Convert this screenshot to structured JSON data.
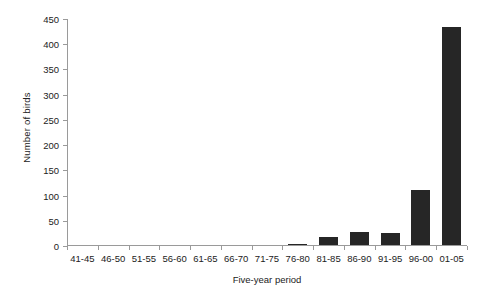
{
  "chart_data": {
    "type": "bar",
    "title": "",
    "xlabel": "Five-year period",
    "ylabel": "Number of birds",
    "categories": [
      "41-45",
      "46-50",
      "51-55",
      "56-60",
      "61-65",
      "66-70",
      "71-75",
      "76-80",
      "81-85",
      "86-90",
      "91-95",
      "96-00",
      "01-05"
    ],
    "values": [
      0,
      0,
      0,
      0,
      0,
      0,
      0,
      3,
      16,
      25,
      23,
      110,
      432
    ],
    "ylim": [
      0,
      450
    ],
    "ytick_values": [
      0,
      50,
      100,
      150,
      200,
      250,
      300,
      350,
      400,
      450
    ],
    "ytick_labels": [
      "0",
      "50",
      "100",
      "150",
      "200",
      "250",
      "300",
      "350",
      "400",
      "450"
    ],
    "grid": false,
    "legend": "none",
    "bar_color": "#262626",
    "axis_color": "#9a9a9a"
  }
}
